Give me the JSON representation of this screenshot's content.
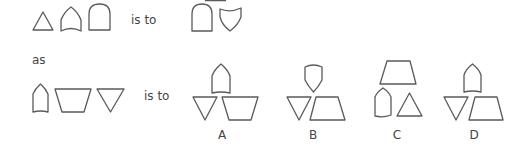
{
  "puzzle": {
    "row1": {
      "relation_text": "is to",
      "source_shapes": [
        "triangle",
        "pointed-arch-curved-base",
        "round-arch"
      ],
      "target_shapes": [
        "round-arch",
        "shield"
      ]
    },
    "connector_text": "as",
    "row2": {
      "relation_text": "is to",
      "source_shapes": [
        "bullet-pentagon",
        "inverted-trapezoid",
        "inverted-triangle"
      ]
    },
    "options": [
      {
        "label": "A",
        "shapes": [
          "bullet-pentagon",
          "inverted-triangle",
          "inverted-trapezoid"
        ]
      },
      {
        "label": "B",
        "shapes": [
          "shield",
          "inverted-triangle",
          "trapezoid"
        ]
      },
      {
        "label": "C",
        "shapes": [
          "trapezoid",
          "bullet-pentagon",
          "triangle"
        ]
      },
      {
        "label": "D",
        "shapes": [
          "bullet-pentagon",
          "inverted-triangle",
          "trapezoid"
        ]
      }
    ]
  },
  "colors": {
    "stroke": "#5a5a5a",
    "text": "#444444",
    "background": "#ffffff"
  }
}
